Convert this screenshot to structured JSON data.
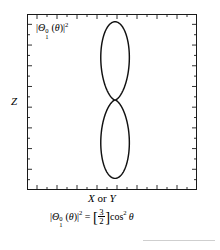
{
  "figure": {
    "title_label": "|Θ₁⁰(θ)|²",
    "axis_z_label": "Z",
    "axis_xy_label": "X or Y",
    "equation_text": "|Θ₁⁰(θ)|² = [3/2]cos²θ",
    "frame_color": "#1a1a1a",
    "curve_color": "#111111",
    "background_color": "#ffffff",
    "rule_color": "#cfcfcf"
  },
  "labels": {
    "theta_symbol": "Θ",
    "superscript_0": "0",
    "subscript_1": "1",
    "theta_arg": "θ",
    "square_exponent": "2",
    "bar": "|",
    "paren_open": "(",
    "paren_close": ")",
    "equals": "=",
    "bracket_open": "[",
    "bracket_close": "]",
    "cos": "cos",
    "numerator": "3",
    "denominator": "2",
    "x_text": "X",
    "or_text": " or ",
    "y_text": "Y",
    "z_text": "Z"
  },
  "chart_data": {
    "type": "line",
    "plot_kind": "polar",
    "xlabel": "X or Y",
    "ylabel": "Z",
    "equation": "|Θ₁⁰(θ)|² = [3/2]cos²θ",
    "function": "r(theta) = 1.5*cos(theta)^2",
    "r_max": 1.5,
    "grid": false,
    "legend": null,
    "axis_ticks": {
      "top_count": 17,
      "bottom_count": 17,
      "left_count": 17,
      "right_count": 17,
      "direction": "inward",
      "alternating_lengths": true,
      "major_tick_px": 5,
      "minor_tick_px": 3
    },
    "axis_ranges": {
      "x": [
        -1.0,
        1.0
      ],
      "y": [
        -1.0,
        1.0
      ]
    },
    "annotations": [
      {
        "text": "|Θ₁⁰(θ)|²",
        "position": "upper-left-inside"
      },
      {
        "text": "Z",
        "position": "left-outside-center"
      },
      {
        "text": "X or Y",
        "position": "below-axis-center"
      },
      {
        "text": "|Θ₁⁰(θ)|² = [3/2]cos²θ",
        "position": "below-figure"
      }
    ],
    "polar_points": [
      {
        "theta_deg": 0,
        "r": 1.5
      },
      {
        "theta_deg": 10,
        "r": 1.455
      },
      {
        "theta_deg": 20,
        "r": 1.324
      },
      {
        "theta_deg": 30,
        "r": 1.125
      },
      {
        "theta_deg": 40,
        "r": 0.88
      },
      {
        "theta_deg": 50,
        "r": 0.62
      },
      {
        "theta_deg": 60,
        "r": 0.375
      },
      {
        "theta_deg": 70,
        "r": 0.175
      },
      {
        "theta_deg": 80,
        "r": 0.045
      },
      {
        "theta_deg": 90,
        "r": 0.0
      },
      {
        "theta_deg": 100,
        "r": 0.045
      },
      {
        "theta_deg": 110,
        "r": 0.175
      },
      {
        "theta_deg": 120,
        "r": 0.375
      },
      {
        "theta_deg": 130,
        "r": 0.62
      },
      {
        "theta_deg": 140,
        "r": 0.88
      },
      {
        "theta_deg": 150,
        "r": 1.125
      },
      {
        "theta_deg": 160,
        "r": 1.324
      },
      {
        "theta_deg": 170,
        "r": 1.455
      },
      {
        "theta_deg": 180,
        "r": 1.5
      }
    ]
  }
}
